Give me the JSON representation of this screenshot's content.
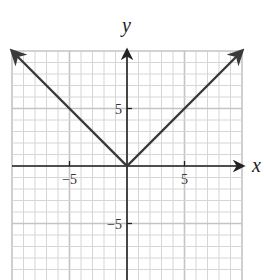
{
  "chart_data": {
    "type": "line",
    "title": "",
    "function": "y = |x|",
    "xlabel": "x",
    "ylabel": "y",
    "xlim": [
      -10,
      10
    ],
    "ylim": [
      -10,
      10
    ],
    "grid": true,
    "grid_step": 1,
    "major_grid_step": 5,
    "x_ticks": [
      -5,
      5
    ],
    "y_ticks": [
      5,
      -5
    ],
    "x_tick_labels": [
      "−5",
      "5"
    ],
    "y_tick_labels": [
      "5",
      "−5"
    ],
    "series": [
      {
        "name": "y = |x|",
        "x": [
          -10,
          0,
          10
        ],
        "y": [
          10,
          0,
          10
        ],
        "arrows": "both-ends"
      }
    ]
  },
  "colors": {
    "grid": "#d6d6d6",
    "grid_major": "#c4c4c4",
    "axis": "#222222",
    "line": "#3a3a3a"
  }
}
